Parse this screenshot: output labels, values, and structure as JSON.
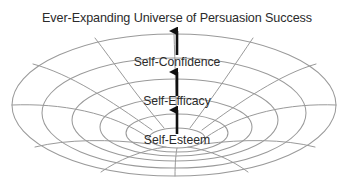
{
  "figure": {
    "title": "Ever-Expanding Universe of Persuasion Success",
    "type": "funnel-vortex-diagram",
    "line_color": "#9a9a9a",
    "text_color": "#2b2b2b",
    "arrow_color": "#101010",
    "background_color": "#ffffff"
  },
  "levels": [
    {
      "id": "self-esteem",
      "label": "Self-Esteem",
      "order": 1
    },
    {
      "id": "self-efficacy",
      "label": "Self-Efficacy",
      "order": 2
    },
    {
      "id": "self-confidence",
      "label": "Self-Confidence",
      "order": 3
    },
    {
      "id": "persuasion-success",
      "label": "Ever-Expanding Universe of Persuasion Success",
      "order": 4
    }
  ],
  "arrows": [
    {
      "id": "arrow-esteem-to-efficacy",
      "direction": "up",
      "from": "self-esteem",
      "to": "self-efficacy"
    },
    {
      "id": "arrow-efficacy-to-confidence",
      "direction": "up",
      "from": "self-efficacy",
      "to": "self-confidence"
    },
    {
      "id": "arrow-confidence-to-universe",
      "direction": "up",
      "from": "self-confidence",
      "to": "persuasion-success"
    }
  ]
}
